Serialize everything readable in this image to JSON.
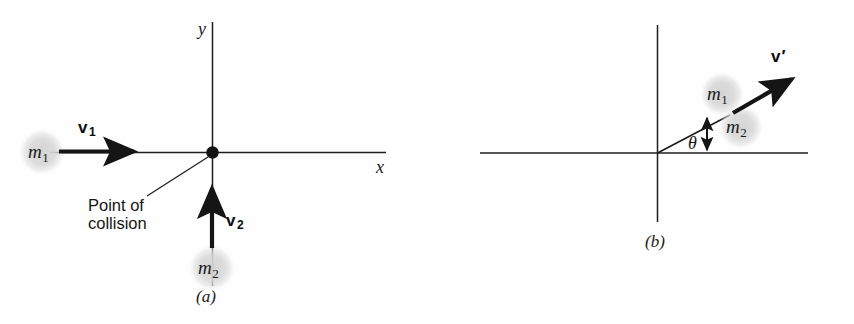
{
  "figure": {
    "type": "physics-diagram",
    "background_color": "#fefefe",
    "ink_color": "#1a1a1a",
    "ball_color": "#d8d8d8"
  },
  "panel_a": {
    "caption": "(a)",
    "axes": {
      "x_label": "x",
      "y_label": "y"
    },
    "collision_point_annotation": "Point of\ncollision",
    "bodies": [
      {
        "label": "m",
        "subscript": "1",
        "name": "mass-m1"
      },
      {
        "label": "m",
        "subscript": "2",
        "name": "mass-m2"
      }
    ],
    "vectors": [
      {
        "label": "v",
        "subscript": "1",
        "name": "velocity-v1",
        "direction": "right"
      },
      {
        "label": "v",
        "subscript": "2",
        "name": "velocity-v2",
        "direction": "up"
      }
    ]
  },
  "panel_b": {
    "caption": "(b)",
    "angle_label": "θ",
    "bodies": [
      {
        "label": "m",
        "subscript": "1",
        "name": "mass-m1"
      },
      {
        "label": "m",
        "subscript": "2",
        "name": "mass-m2"
      }
    ],
    "vectors": [
      {
        "label": "v",
        "prime": "′",
        "name": "velocity-v-prime",
        "direction": "up-right"
      }
    ]
  }
}
